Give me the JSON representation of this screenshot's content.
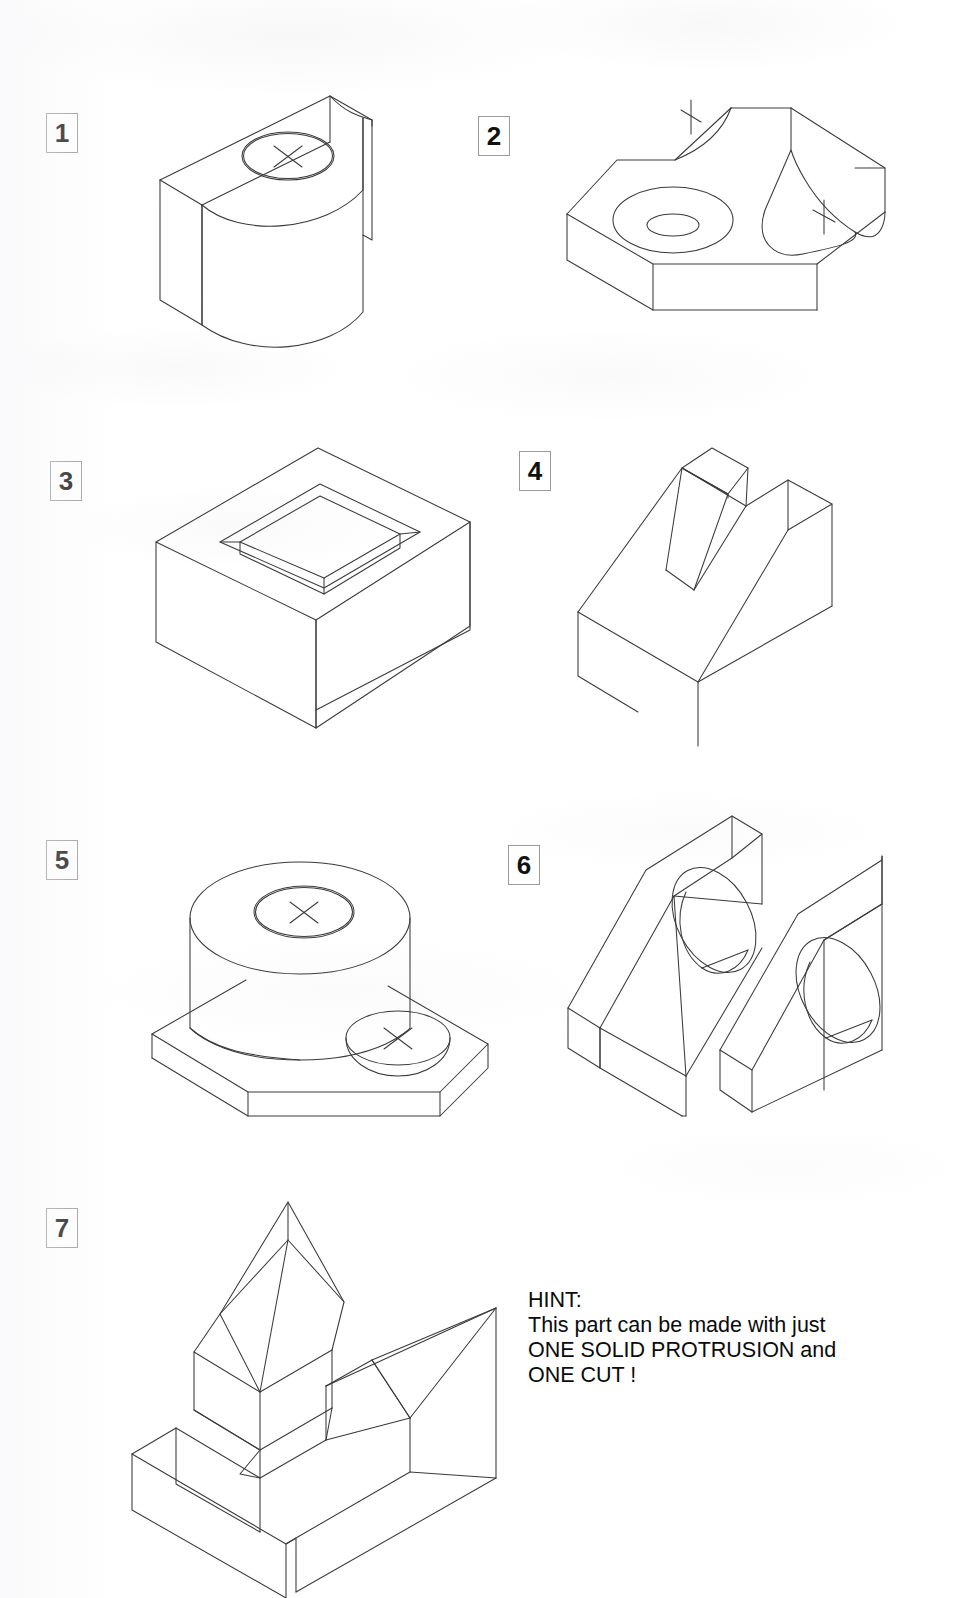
{
  "sheet": {
    "kind": "isometric-pictorial-exercise-sheet",
    "background_color": "#ffffff",
    "line_color": "#3a3a3a",
    "text_color": "#0b0b0b"
  },
  "figures": [
    {
      "number": "1",
      "label_box": {
        "x": 46,
        "y": 113
      },
      "name": "half-cylinder-block-with-counterbore",
      "features": [
        "rectangular slab",
        "half cylinder boss",
        "counterbored hole on top",
        "center mark cross"
      ],
      "center_marks": 1
    },
    {
      "number": "2",
      "label_box": {
        "x": 478,
        "y": 116
      },
      "name": "chamfered-plate-with-counterbore-and-round-slot",
      "features": [
        "chamfered corner base plate",
        "large counterbored hole",
        "concave radiused slot",
        "raised back rail"
      ],
      "center_marks": 2
    },
    {
      "number": "3",
      "label_box": {
        "x": 50,
        "y": 461
      },
      "name": "rectangular-box-with-rectangular-pocket",
      "features": [
        "rectangular block",
        "rectangular recessed pocket"
      ],
      "center_marks": 0
    },
    {
      "number": "4",
      "label_box": {
        "x": 519,
        "y": 451
      },
      "name": "inclined-wedge-with-v-groove",
      "features": [
        "wedge / ramp block",
        "tapered central rib",
        "V shaped groove"
      ],
      "center_marks": 0
    },
    {
      "number": "5",
      "label_box": {
        "x": 46,
        "y": 840
      },
      "name": "cylindrical-boss-on-base-plate",
      "features": [
        "tall cylinder boss",
        "counterbored hole in cylinder top",
        "flat base plate",
        "counterbored hole in plate"
      ],
      "center_marks": 2
    },
    {
      "number": "6",
      "label_box": {
        "x": 508,
        "y": 845
      },
      "name": "twin-rib-bracket-with-through-holes",
      "features": [
        "two angled ribs",
        "two large through holes",
        "base plate",
        "central slot"
      ],
      "center_marks": 0
    },
    {
      "number": "7",
      "label_box": {
        "x": 46,
        "y": 1208
      },
      "name": "peaked-tower-on-slotted-base",
      "features": [
        "gabled / peaked tower",
        "angular pedestal",
        "slotted base plate",
        "triangular wedge rib"
      ],
      "center_marks": 0
    }
  ],
  "hint": {
    "heading": "HINT:",
    "lines": [
      "This part can be made with just",
      "ONE SOLID PROTRUSION and",
      "ONE CUT !"
    ],
    "full_text": "HINT:\nThis part can be made with just\nONE SOLID PROTRUSION and\nONE CUT !"
  }
}
